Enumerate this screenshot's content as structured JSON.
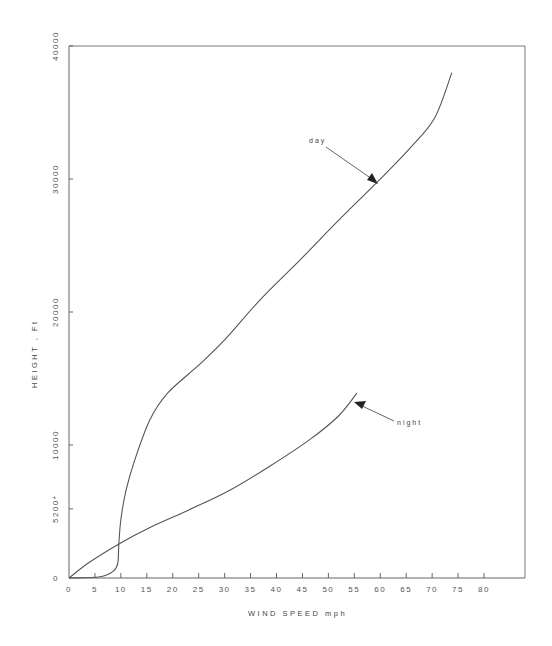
{
  "chart_data": {
    "type": "line",
    "title": "",
    "xlabel": "WIND SPEED  mph",
    "ylabel": "HEIGHT , Ft",
    "xlim": [
      0,
      80
    ],
    "ylim": [
      0,
      40000
    ],
    "grid": false,
    "legend": "none (curves annotated with arrows)",
    "x_ticks": [
      0,
      5,
      10,
      15,
      20,
      25,
      30,
      35,
      40,
      45,
      50,
      55,
      60,
      65,
      70,
      75,
      80
    ],
    "x_tick_labels": [
      "0",
      "5",
      "10",
      "15",
      "20",
      "25",
      "30",
      "35",
      "40",
      "45",
      "50",
      "55",
      "60",
      "65",
      "70",
      "75",
      "80"
    ],
    "y_ticks": [
      0,
      5200,
      10000,
      20000,
      30000,
      40000
    ],
    "y_tick_labels": [
      "0",
      "5200*",
      "10000",
      "20000",
      "30000",
      "40000"
    ],
    "series": [
      {
        "name": "day",
        "x": [
          0,
          6,
          8.5,
          9.4,
          9.6,
          10,
          11,
          12.7,
          15.6,
          19,
          25,
          30,
          36.8,
          44.5,
          52,
          59.5,
          65.7,
          70.5,
          73.8
        ],
        "y": [
          0,
          100,
          500,
          1100,
          2500,
          4400,
          6600,
          8900,
          11900,
          13900,
          16000,
          17900,
          20900,
          23900,
          26900,
          29800,
          32300,
          34600,
          38000
        ]
      },
      {
        "name": "night",
        "x": [
          0,
          4,
          9.8,
          15.6,
          23,
          31,
          38.7,
          46.4,
          52,
          55.5
        ],
        "y": [
          0,
          1200,
          2600,
          3800,
          5100,
          6600,
          8400,
          10400,
          12200,
          13900
        ]
      }
    ],
    "annotations": [
      {
        "text": "day",
        "arrow_to": [
          59.5,
          29800
        ]
      },
      {
        "text": "night",
        "arrow_to": [
          55,
          13500
        ]
      }
    ]
  },
  "labels": {
    "xlabel": "WIND SPEED  mph",
    "ylabel": "HEIGHT , Ft",
    "day": "day",
    "night": "night"
  },
  "colors": {
    "axis": "#666666",
    "curve": "#555555",
    "text": "#444444"
  }
}
